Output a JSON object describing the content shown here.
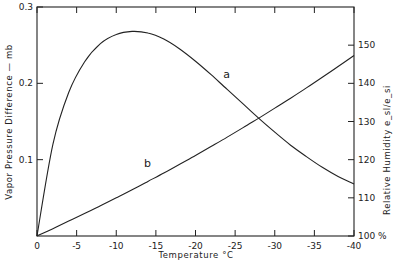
{
  "chart_data": {
    "type": "line",
    "title": "",
    "xlabel": "Temperature °C",
    "ylabel": "Vapor Pressure Difference — mb",
    "y2label": "Relative Humidity e_sl/e_si",
    "xlim": [
      0,
      -40
    ],
    "ylim": [
      0,
      0.3
    ],
    "y2lim": [
      100,
      160
    ],
    "grid": false,
    "x_ticks": [
      "0",
      "-5",
      "-10",
      "-15",
      "-20",
      "-25",
      "-30",
      "-35",
      "-40"
    ],
    "y_ticks": [
      "0.3",
      "0.2",
      "0.1"
    ],
    "y2_ticks": [
      "150",
      "140",
      "130",
      "120",
      "110",
      "100 %"
    ],
    "x": [
      0,
      -2,
      -4,
      -6,
      -8,
      -10,
      -12,
      -14,
      -16,
      -18,
      -20,
      -22,
      -24,
      -26,
      -28,
      -30,
      -32,
      -34,
      -36,
      -38,
      -40
    ],
    "series": [
      {
        "name": "a",
        "axis": "left",
        "description": "Vapor pressure difference (e_sl - e_si), mb",
        "values": [
          0,
          0.12,
          0.188,
          0.228,
          0.252,
          0.264,
          0.268,
          0.266,
          0.258,
          0.245,
          0.229,
          0.211,
          0.192,
          0.173,
          0.154,
          0.136,
          0.119,
          0.104,
          0.09,
          0.078,
          0.068
        ]
      },
      {
        "name": "b",
        "axis": "right",
        "description": "Relative humidity over ice e_sl/e_si, %",
        "values": [
          100,
          101.9,
          103.9,
          105.9,
          107.9,
          110.0,
          112.1,
          114.3,
          116.5,
          118.8,
          121.1,
          123.5,
          125.9,
          128.4,
          130.9,
          133.5,
          136.1,
          138.8,
          141.6,
          144.4,
          147.3
        ]
      }
    ],
    "annotations": [
      {
        "text": "a",
        "x": -23.5,
        "y": 0.207
      },
      {
        "text": "b",
        "x": -13.5,
        "y2": 118
      }
    ]
  }
}
